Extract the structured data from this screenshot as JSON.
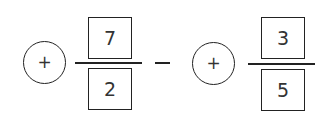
{
  "expression": {
    "terms": [
      {
        "sign_symbol": "+",
        "numerator": "7",
        "denominator": "2"
      },
      {
        "sign_symbol": "+",
        "numerator": "3",
        "denominator": "5"
      }
    ],
    "operator": "−"
  }
}
